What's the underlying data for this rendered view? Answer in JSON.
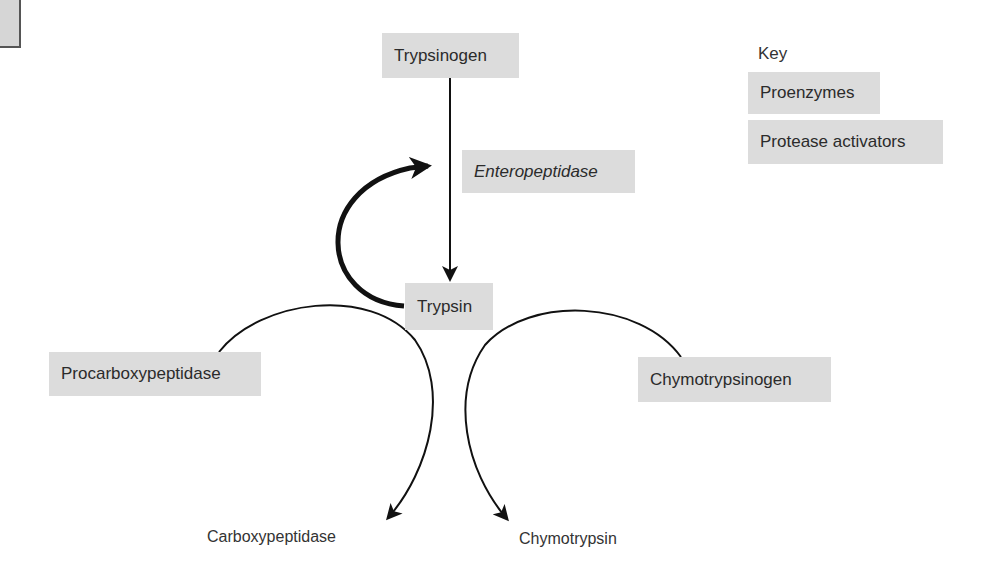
{
  "diagram": {
    "nodes": {
      "trypsinogen": "Trypsinogen",
      "enteropeptidase": "Enteropeptidase",
      "trypsin": "Trypsin",
      "procarboxypeptidase": "Procarboxypeptidase",
      "chymotrypsinogen": "Chymotrypsinogen",
      "carboxypeptidase": "Carboxypeptidase",
      "chymotrypsin": "Chymotrypsin"
    },
    "edges": [
      {
        "from": "Trypsinogen",
        "to": "Trypsin",
        "label": "Enteropeptidase"
      },
      {
        "from": "Trypsin",
        "to": "Trypsinogen activation",
        "style": "thick-feedback"
      },
      {
        "from": "Procarboxypeptidase",
        "to": "Carboxypeptidase",
        "via": "Trypsin"
      },
      {
        "from": "Chymotrypsinogen",
        "to": "Chymotrypsin",
        "via": "Trypsin"
      }
    ],
    "key": {
      "title": "Key",
      "items": [
        "Proenzymes",
        "Protease activators"
      ]
    },
    "colors": {
      "box_fill": "#dcdcdc",
      "line": "#1a1a1a",
      "text": "#2b2b2b"
    }
  }
}
